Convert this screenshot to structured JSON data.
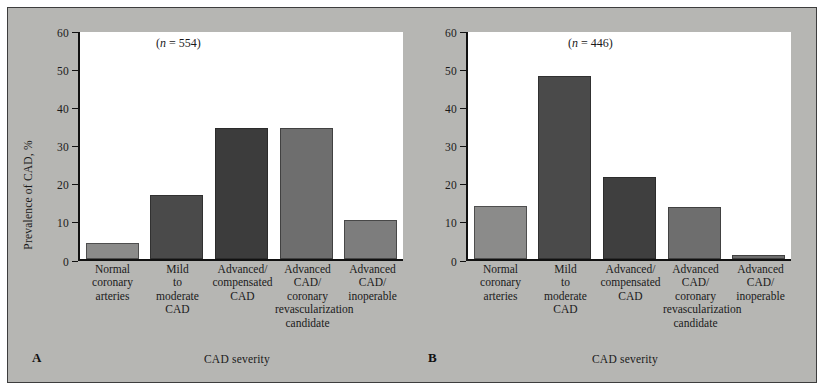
{
  "figure": {
    "background_color": "#b6b6b3",
    "border_color": "#3d3d3d",
    "plot_background": "#ffffff"
  },
  "chart_data": [
    {
      "type": "bar",
      "panel": "A",
      "panel_letter": "A",
      "title": "",
      "annotation": "(n = 554)",
      "annotation_n": 554,
      "annotation_prefix": "(",
      "annotation_symbol": "n",
      "annotation_rest": " = 554)",
      "xlabel": "CAD severity",
      "ylabel": "Prevalence of CAD, %",
      "categories": [
        "Normal coronary arteries",
        "Mild to moderate CAD",
        "Advanced/ compensated CAD",
        "Advanced CAD/ coronary revascularization candidate",
        "Advanced CAD/ inoperable"
      ],
      "category_lines": [
        [
          "Normal",
          "coronary",
          "arteries"
        ],
        [
          "Mild",
          "to",
          "moderate",
          "CAD"
        ],
        [
          "Advanced/",
          "compensated",
          "CAD"
        ],
        [
          "Advanced",
          "CAD/",
          "coronary",
          "revascularization",
          "candidate"
        ],
        [
          "Advanced",
          "CAD/",
          "inoperable"
        ]
      ],
      "values": [
        4.2,
        17.0,
        34.6,
        34.6,
        10.2
      ],
      "bar_colors": [
        "#8b8b8a",
        "#4a4a4a",
        "#3c3c3c",
        "#6e6e6e",
        "#7d7d7d"
      ],
      "ylim": [
        0,
        60
      ],
      "yticks": [
        0,
        10,
        20,
        30,
        40,
        50,
        60
      ],
      "ytick_labels": [
        "0",
        "10",
        "20",
        "30",
        "40",
        "50",
        "60"
      ],
      "grid": false,
      "legend": "none"
    },
    {
      "type": "bar",
      "panel": "B",
      "panel_letter": "B",
      "title": "",
      "annotation": "(n = 446)",
      "annotation_n": 446,
      "annotation_prefix": "(",
      "annotation_symbol": "n",
      "annotation_rest": " = 446)",
      "xlabel": "CAD severity",
      "ylabel": "",
      "categories": [
        "Normal coronary arteries",
        "Mild to moderate CAD",
        "Advanced/ compensated CAD",
        "Advanced CAD/ coronary revascularization candidate",
        "Advanced CAD/ inoperable"
      ],
      "category_lines": [
        [
          "Normal",
          "coronary",
          "arteries"
        ],
        [
          "Mild",
          "to",
          "moderate",
          "CAD"
        ],
        [
          "Advanced/",
          "compensated",
          "CAD"
        ],
        [
          "Advanced",
          "CAD/",
          "coronary",
          "revascularization",
          "candidate"
        ],
        [
          "Advanced",
          "CAD/",
          "inoperable"
        ]
      ],
      "values": [
        14.0,
        48.4,
        21.6,
        13.8,
        1.1
      ],
      "bar_colors": [
        "#8b8b8a",
        "#4a4a4a",
        "#3f3f3f",
        "#6e6e6e",
        "#6e6e6e"
      ],
      "ylim": [
        0,
        60
      ],
      "yticks": [
        0,
        10,
        20,
        30,
        40,
        50,
        60
      ],
      "ytick_labels": [
        "0",
        "10",
        "20",
        "30",
        "40",
        "50",
        "60"
      ],
      "grid": false,
      "legend": "none"
    }
  ]
}
